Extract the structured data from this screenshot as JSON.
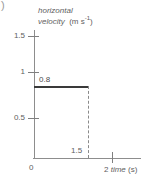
{
  "figure": {
    "label_fragment": ")",
    "axis_title": {
      "line1": "horizontal",
      "line2": "velocity",
      "unit_open": "(m s",
      "unit_exp": "-1",
      "unit_close": ")"
    }
  },
  "y_axis": {
    "ticks": [
      {
        "label": "1.5",
        "value": 1.5
      },
      {
        "label": "1",
        "value": 1.0
      },
      {
        "label": "0.5",
        "value": 0.5
      }
    ],
    "origin_label": "0"
  },
  "x_axis": {
    "ticks": [
      {
        "label": "2",
        "value": 2
      }
    ],
    "guide_label": "1.5",
    "caption_value": "2",
    "caption_name": "time",
    "caption_unit": "(s)"
  },
  "annotations": {
    "plateau_value": "0.8"
  },
  "colors": {
    "axis": "#8d8d8d",
    "tick": "#7f7f7f",
    "text": "#5e5e5e",
    "series": "#3a3a3a",
    "dashed": "#8a8a8a",
    "background": "#ffffff"
  },
  "chart_data": {
    "type": "line",
    "title": "",
    "xlabel": "time (s)",
    "ylabel": "horizontal velocity (m s-1)",
    "xlim": [
      0,
      2.3
    ],
    "ylim": [
      0,
      1.72
    ],
    "xticks": [
      0,
      2
    ],
    "xticklabels": [
      "0",
      "2"
    ],
    "yticks": [
      0,
      0.5,
      1,
      1.5
    ],
    "yticklabels": [
      "0",
      "0.5",
      "1",
      "1.5"
    ],
    "grid": false,
    "legend": null,
    "series": [
      {
        "name": "horizontal velocity",
        "style": "solid",
        "x": [
          0,
          1.5
        ],
        "y": [
          0.8,
          0.8
        ]
      },
      {
        "name": "drop to zero at t = 1.5 s",
        "style": "dashed",
        "x": [
          1.5,
          1.5
        ],
        "y": [
          0.8,
          0
        ]
      }
    ],
    "annotations": [
      {
        "text": "0.8",
        "x": 0.08,
        "y": 0.88
      },
      {
        "text": "1.5",
        "x": 1.38,
        "y": 0.1
      }
    ]
  }
}
